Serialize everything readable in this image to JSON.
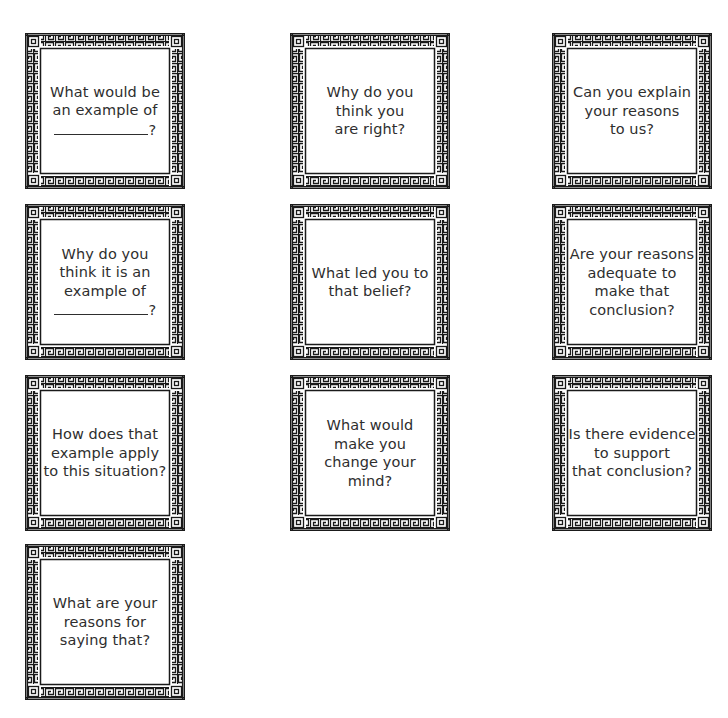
{
  "page": {
    "background": "#ffffff",
    "text_color": "#2e2e2e",
    "border_color": "#1a1a1a"
  },
  "cards": [
    {
      "lines": [
        "What would be",
        "an example of",
        "{blank}?"
      ]
    },
    {
      "lines": [
        "Why do you",
        "think you",
        "are right?"
      ]
    },
    {
      "lines": [
        "Can you explain",
        "your reasons",
        "to us?"
      ]
    },
    {
      "lines": [
        "Why do you",
        "think it is an",
        "example of",
        "{blank}?"
      ]
    },
    {
      "lines": [
        "What led you to",
        "that belief?"
      ]
    },
    {
      "lines": [
        "Are your reasons",
        "adequate to",
        "make that",
        "conclusion?"
      ]
    },
    {
      "lines": [
        "How does that",
        "example apply",
        "to this situation?"
      ]
    },
    {
      "lines": [
        "What would",
        "make you",
        "change your",
        "mind?"
      ]
    },
    {
      "lines": [
        "Is there evidence",
        "to support",
        "that conclusion?"
      ]
    },
    {
      "lines": [
        "What are your",
        "reasons for",
        "saying that?"
      ]
    }
  ],
  "blank": {
    "suffix": "?"
  },
  "icons": {
    "frame": "greek-key-border"
  }
}
